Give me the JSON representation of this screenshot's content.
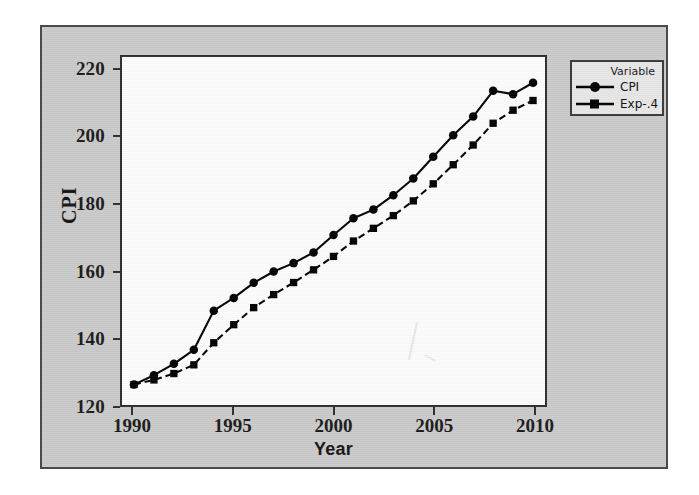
{
  "figure": {
    "background_color": "#c9c9c9",
    "plot_background_color": "#fbfbfb",
    "border_color": "#2e2e2e"
  },
  "legend": {
    "title": "Variable",
    "entries": [
      {
        "label": "CPI",
        "marker": "circle-marker",
        "line_style": "solid",
        "color": "#000000"
      },
      {
        "label": "Exp-.4",
        "marker": "square-marker",
        "line_style": "dashed",
        "color": "#000000"
      }
    ]
  },
  "chart_data": {
    "type": "line",
    "title": "",
    "xlabel": "Year",
    "ylabel": "CPI",
    "xlim": [
      1989.4,
      2010.6
    ],
    "ylim": [
      120,
      224
    ],
    "xticks": [
      1990,
      1995,
      2000,
      2005,
      2010
    ],
    "yticks": [
      120,
      140,
      160,
      180,
      200,
      220
    ],
    "grid": false,
    "legend_position": "outside-top-right",
    "x": [
      1990,
      1991,
      1992,
      1993,
      1994,
      1995,
      1996,
      1997,
      1998,
      1999,
      2000,
      2001,
      2002,
      2003,
      2004,
      2005,
      2006,
      2007,
      2008,
      2009,
      2010
    ],
    "series": [
      {
        "name": "CPI",
        "marker": "circle",
        "line_style": "solid",
        "values": [
          126.1,
          128.9,
          132.3,
          136.5,
          148.2,
          152.0,
          156.5,
          159.9,
          162.4,
          165.6,
          170.8,
          175.8,
          178.4,
          182.7,
          187.7,
          194.2,
          200.6,
          206.2,
          213.9,
          212.9,
          216.3
        ]
      },
      {
        "name": "Exp-.4",
        "marker": "square",
        "line_style": "dashed",
        "values": [
          126.1,
          127.5,
          129.4,
          132.0,
          138.6,
          144.0,
          149.1,
          153.0,
          156.6,
          160.4,
          164.4,
          169.0,
          172.8,
          176.6,
          181.0,
          186.1,
          191.8,
          197.7,
          204.2,
          208.1,
          211.0
        ]
      }
    ]
  }
}
